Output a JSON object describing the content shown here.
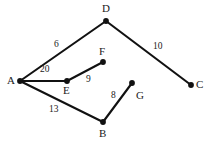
{
  "figure": {
    "title": "",
    "background_color": "#ffffff",
    "stroke_color": "#111111",
    "text_color": "#1a1a1a",
    "width": 211,
    "height": 146
  },
  "chart_data": {
    "type": "diagram",
    "diagram_kind": "weighted-undirected-graph",
    "title": "",
    "xlabel": "",
    "ylabel": "",
    "grid": false,
    "legend": "none",
    "nodes": [
      {
        "id": "A",
        "label": "A",
        "x": 20,
        "y": 81,
        "label_x": 7,
        "label_y": 75
      },
      {
        "id": "B",
        "label": "B",
        "x": 103,
        "y": 122,
        "label_x": 99,
        "label_y": 128
      },
      {
        "id": "C",
        "label": "C",
        "x": 191,
        "y": 85,
        "label_x": 196,
        "label_y": 79
      },
      {
        "id": "D",
        "label": "D",
        "x": 106,
        "y": 21,
        "label_x": 102,
        "label_y": 3
      },
      {
        "id": "E",
        "label": "E",
        "x": 67,
        "y": 81,
        "label_x": 63,
        "label_y": 85
      },
      {
        "id": "F",
        "label": "F",
        "x": 103,
        "y": 62,
        "label_x": 99,
        "label_y": 46
      },
      {
        "id": "G",
        "label": "G",
        "x": 132,
        "y": 83,
        "label_x": 136,
        "label_y": 90
      }
    ],
    "edges": [
      {
        "from": "A",
        "to": "D",
        "weight": 6,
        "label": "6",
        "label_x": 54,
        "label_y": 40
      },
      {
        "from": "D",
        "to": "C",
        "weight": 10,
        "label": "10",
        "label_x": 153,
        "label_y": 42
      },
      {
        "from": "A",
        "to": "E",
        "weight": 20,
        "label": "20",
        "label_x": 40,
        "label_y": 65
      },
      {
        "from": "E",
        "to": "F",
        "weight": 9,
        "label": "9",
        "label_x": 86,
        "label_y": 75
      },
      {
        "from": "A",
        "to": "B",
        "weight": 13,
        "label": "13",
        "label_x": 49,
        "label_y": 105
      },
      {
        "from": "B",
        "to": "G",
        "weight": 8,
        "label": "8",
        "label_x": 111,
        "label_y": 91
      }
    ],
    "node_labels": [
      "A",
      "B",
      "C",
      "D",
      "E",
      "F",
      "G"
    ],
    "edge_weights": [
      6,
      10,
      20,
      9,
      13,
      8
    ]
  }
}
